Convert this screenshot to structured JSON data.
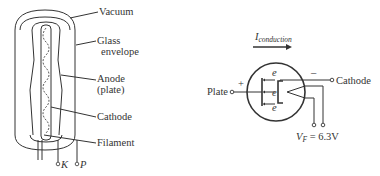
{
  "tube_diagram": {
    "labels": {
      "vacuum": "Vacuum",
      "glass_line1": "Glass",
      "glass_line2": "envelope",
      "anode_line1": "Anode",
      "anode_line2": "(plate)",
      "cathode": "Cathode",
      "filament": "Filament"
    },
    "pins": {
      "k": "K",
      "p": "P"
    }
  },
  "symbol_diagram": {
    "current_label": "I",
    "current_subscript": "conduction",
    "plate_label": "Plate",
    "plate_polarity": "+",
    "cathode_label": "Cathode",
    "cathode_polarity": "–",
    "electron_labels": [
      "e",
      "e",
      "e"
    ],
    "filament_voltage_symbol": "V",
    "filament_voltage_subscript": "F",
    "filament_voltage_value": " = 6.3V"
  }
}
